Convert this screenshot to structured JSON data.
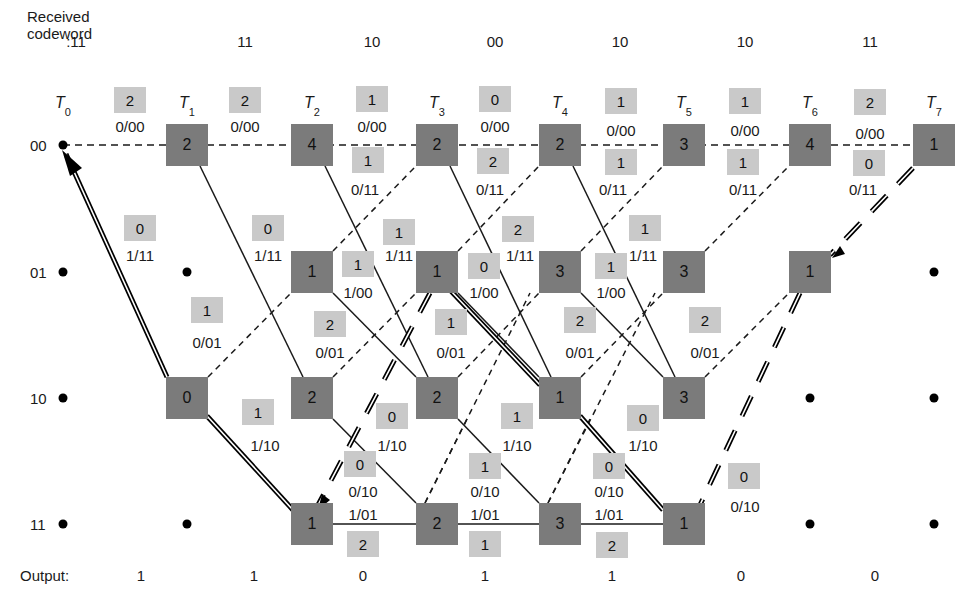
{
  "header": {
    "received_label_line1": "Received",
    "received_label_line2": "codeword",
    "codewords": [
      ":11",
      "11",
      "10",
      "00",
      "10",
      "10",
      "11"
    ],
    "codeword_x": [
      76,
      245,
      372,
      495,
      620,
      745,
      870
    ]
  },
  "time_labels": [
    {
      "t": "T",
      "sub": "0",
      "x": 63
    },
    {
      "t": "T",
      "sub": "1",
      "x": 187
    },
    {
      "t": "T",
      "sub": "2",
      "x": 312
    },
    {
      "t": "T",
      "sub": "3",
      "x": 437
    },
    {
      "t": "T",
      "sub": "4",
      "x": 560
    },
    {
      "t": "T",
      "sub": "5",
      "x": 684
    },
    {
      "t": "T",
      "sub": "6",
      "x": 810
    },
    {
      "t": "T",
      "sub": "7",
      "x": 934
    }
  ],
  "states": [
    {
      "label": "00",
      "y": 145
    },
    {
      "label": "01",
      "y": 272
    },
    {
      "label": "10",
      "y": 398
    },
    {
      "label": "11",
      "y": 524
    }
  ],
  "state_boxes": [
    {
      "col": 1,
      "row": 0,
      "metric": "2"
    },
    {
      "col": 2,
      "row": 0,
      "metric": "4"
    },
    {
      "col": 3,
      "row": 0,
      "metric": "2"
    },
    {
      "col": 4,
      "row": 0,
      "metric": "2"
    },
    {
      "col": 5,
      "row": 0,
      "metric": "3"
    },
    {
      "col": 6,
      "row": 0,
      "metric": "4"
    },
    {
      "col": 7,
      "row": 0,
      "metric": "1"
    },
    {
      "col": 2,
      "row": 1,
      "metric": "1"
    },
    {
      "col": 3,
      "row": 1,
      "metric": "1"
    },
    {
      "col": 4,
      "row": 1,
      "metric": "3"
    },
    {
      "col": 5,
      "row": 1,
      "metric": "3"
    },
    {
      "col": 6,
      "row": 1,
      "metric": "1"
    },
    {
      "col": 1,
      "row": 2,
      "metric": "0"
    },
    {
      "col": 2,
      "row": 2,
      "metric": "2"
    },
    {
      "col": 3,
      "row": 2,
      "metric": "2"
    },
    {
      "col": 4,
      "row": 2,
      "metric": "1"
    },
    {
      "col": 5,
      "row": 2,
      "metric": "3"
    },
    {
      "col": 2,
      "row": 3,
      "metric": "1"
    },
    {
      "col": 3,
      "row": 3,
      "metric": "2"
    },
    {
      "col": 4,
      "row": 3,
      "metric": "3"
    },
    {
      "col": 5,
      "row": 3,
      "metric": "1"
    }
  ],
  "empty_dots": [
    {
      "col": 0,
      "row": 0
    },
    {
      "col": 0,
      "row": 1
    },
    {
      "col": 0,
      "row": 2
    },
    {
      "col": 0,
      "row": 3
    },
    {
      "col": 1,
      "row": 1
    },
    {
      "col": 1,
      "row": 3
    },
    {
      "col": 7,
      "row": 1
    },
    {
      "col": 6,
      "row": 2
    },
    {
      "col": 7,
      "row": 2
    },
    {
      "col": 6,
      "row": 3
    },
    {
      "col": 7,
      "row": 3
    }
  ],
  "branch_metrics": [
    {
      "value": "2",
      "x": 130,
      "y": 100
    },
    {
      "text": "0/00",
      "x": 130,
      "y": 126
    },
    {
      "value": "2",
      "x": 245,
      "y": 100
    },
    {
      "text": "0/00",
      "x": 245,
      "y": 126
    },
    {
      "value": "1",
      "x": 372,
      "y": 99
    },
    {
      "text": "0/00",
      "x": 372,
      "y": 126
    },
    {
      "value": "0",
      "x": 495,
      "y": 99
    },
    {
      "text": "0/00",
      "x": 495,
      "y": 126
    },
    {
      "value": "1",
      "x": 621,
      "y": 101
    },
    {
      "text": "0/00",
      "x": 621,
      "y": 130
    },
    {
      "value": "1",
      "x": 745,
      "y": 101
    },
    {
      "text": "0/00",
      "x": 745,
      "y": 130
    },
    {
      "value": "2",
      "x": 870,
      "y": 102
    },
    {
      "text": "0/00",
      "x": 870,
      "y": 133
    },
    {
      "value": "1",
      "x": 368,
      "y": 160
    },
    {
      "text": "0/11",
      "x": 365,
      "y": 189
    },
    {
      "value": "2",
      "x": 493,
      "y": 161
    },
    {
      "text": "0/11",
      "x": 490,
      "y": 189
    },
    {
      "value": "1",
      "x": 621,
      "y": 162
    },
    {
      "text": "0/11",
      "x": 613,
      "y": 189
    },
    {
      "value": "1",
      "x": 743,
      "y": 162
    },
    {
      "text": "0/11",
      "x": 743,
      "y": 189
    },
    {
      "value": "0",
      "x": 869,
      "y": 163
    },
    {
      "text": "0/11",
      "x": 863,
      "y": 189
    },
    {
      "value": "0",
      "x": 140,
      "y": 228
    },
    {
      "text": "1/11",
      "x": 140,
      "y": 255
    },
    {
      "value": "0",
      "x": 268,
      "y": 228
    },
    {
      "text": "1/11",
      "x": 268,
      "y": 255
    },
    {
      "value": "1",
      "x": 399,
      "y": 232
    },
    {
      "text": "1/11",
      "x": 399,
      "y": 255
    },
    {
      "value": "2",
      "x": 518,
      "y": 229
    },
    {
      "text": "1/11",
      "x": 520,
      "y": 255
    },
    {
      "value": "1",
      "x": 645,
      "y": 228
    },
    {
      "text": "1/11",
      "x": 643,
      "y": 255
    },
    {
      "value": "1",
      "x": 358,
      "y": 264
    },
    {
      "text": "1/00",
      "x": 358,
      "y": 292
    },
    {
      "value": "0",
      "x": 484,
      "y": 266
    },
    {
      "text": "1/00",
      "x": 484,
      "y": 292
    },
    {
      "value": "1",
      "x": 611,
      "y": 266
    },
    {
      "text": "1/00",
      "x": 611,
      "y": 292
    },
    {
      "value": "1",
      "x": 207,
      "y": 310
    },
    {
      "text": "0/01",
      "x": 207,
      "y": 342
    },
    {
      "value": "2",
      "x": 330,
      "y": 324
    },
    {
      "text": "0/01",
      "x": 330,
      "y": 352
    },
    {
      "value": "1",
      "x": 451,
      "y": 322
    },
    {
      "text": "0/01",
      "x": 451,
      "y": 352
    },
    {
      "value": "2",
      "x": 580,
      "y": 320
    },
    {
      "text": "0/01",
      "x": 580,
      "y": 352
    },
    {
      "value": "2",
      "x": 705,
      "y": 320
    },
    {
      "text": "0/01",
      "x": 705,
      "y": 352
    },
    {
      "value": "1",
      "x": 258,
      "y": 412
    },
    {
      "text": "1/10",
      "x": 265,
      "y": 445
    },
    {
      "value": "0",
      "x": 392,
      "y": 416
    },
    {
      "text": "1/10",
      "x": 392,
      "y": 445
    },
    {
      "value": "1",
      "x": 517,
      "y": 416
    },
    {
      "text": "1/10",
      "x": 517,
      "y": 445
    },
    {
      "value": "0",
      "x": 643,
      "y": 418
    },
    {
      "text": "1/10",
      "x": 643,
      "y": 445
    },
    {
      "value": "0",
      "x": 360,
      "y": 464
    },
    {
      "text": "0/10",
      "x": 363,
      "y": 491
    },
    {
      "value": "1",
      "x": 485,
      "y": 466
    },
    {
      "text": "0/10",
      "x": 485,
      "y": 491
    },
    {
      "value": "0",
      "x": 609,
      "y": 466
    },
    {
      "text": "0/10",
      "x": 609,
      "y": 491
    },
    {
      "value": "0",
      "x": 744,
      "y": 476
    },
    {
      "text": "0/10",
      "x": 745,
      "y": 506
    },
    {
      "text": "1/01",
      "x": 363,
      "y": 514
    },
    {
      "value": "2",
      "x": 363,
      "y": 544
    },
    {
      "text": "1/01",
      "x": 485,
      "y": 514
    },
    {
      "value": "1",
      "x": 485,
      "y": 544
    },
    {
      "text": "1/01",
      "x": 609,
      "y": 514
    },
    {
      "value": "2",
      "x": 612,
      "y": 545
    }
  ],
  "output": {
    "label": "Output:",
    "bits": [
      "1",
      "1",
      "0",
      "1",
      "1",
      "0",
      "0"
    ],
    "x": [
      141,
      254,
      363,
      485,
      612,
      741,
      875
    ]
  },
  "colors": {
    "state_box": "#7b7b7b",
    "metric_box": "#c9c9c9",
    "line": "#1a1a1a"
  }
}
